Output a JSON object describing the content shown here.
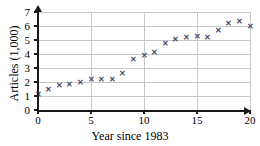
{
  "chart_data": {
    "type": "scatter",
    "title": "",
    "xlabel": "Year since 1983",
    "ylabel": "Articles (1,000)",
    "xlim": [
      0,
      20
    ],
    "ylim": [
      0,
      7
    ],
    "xticks": [
      0,
      5,
      10,
      15,
      20
    ],
    "yticks": [
      0,
      1,
      2,
      3,
      4,
      5,
      6,
      7
    ],
    "xtick_labels": [
      "0",
      "5",
      "10",
      "15",
      "20"
    ],
    "ytick_labels": [
      "0",
      "1",
      "2",
      "3",
      "4",
      "5",
      "6",
      "7"
    ],
    "grid": true,
    "grid_orientation": "both",
    "legend": null,
    "marker": "x",
    "marker_color": "#4a4a6a",
    "axis_color": "#1a1a1a",
    "grid_color": "#c9c9c9",
    "background": "#ffffff",
    "x": [
      0,
      1,
      2,
      3,
      4,
      5,
      6,
      7,
      8,
      9,
      10,
      11,
      12,
      13,
      14,
      15,
      16,
      17,
      18,
      19,
      20
    ],
    "values": [
      1.1,
      1.5,
      1.75,
      1.85,
      2.0,
      2.15,
      2.2,
      2.2,
      2.6,
      3.6,
      3.9,
      4.1,
      4.75,
      5.05,
      5.15,
      5.25,
      5.15,
      5.7,
      6.2,
      6.3,
      5.95
    ],
    "points": [
      {
        "x": 0,
        "y": 1.1
      },
      {
        "x": 1,
        "y": 1.5
      },
      {
        "x": 2,
        "y": 1.75
      },
      {
        "x": 3,
        "y": 1.85
      },
      {
        "x": 4,
        "y": 2.0
      },
      {
        "x": 5,
        "y": 2.15
      },
      {
        "x": 6,
        "y": 2.2
      },
      {
        "x": 7,
        "y": 2.2
      },
      {
        "x": 8,
        "y": 2.6
      },
      {
        "x": 9,
        "y": 3.6
      },
      {
        "x": 10,
        "y": 3.9
      },
      {
        "x": 11,
        "y": 4.1
      },
      {
        "x": 12,
        "y": 4.75
      },
      {
        "x": 13,
        "y": 5.05
      },
      {
        "x": 14,
        "y": 5.15
      },
      {
        "x": 15,
        "y": 5.25
      },
      {
        "x": 16,
        "y": 5.15
      },
      {
        "x": 17,
        "y": 5.7
      },
      {
        "x": 18,
        "y": 6.2
      },
      {
        "x": 19,
        "y": 6.3
      },
      {
        "x": 20,
        "y": 5.95
      }
    ],
    "marker_glyph": "✕"
  }
}
